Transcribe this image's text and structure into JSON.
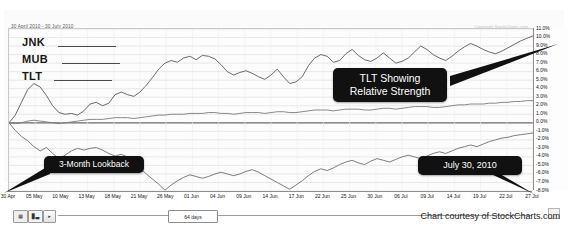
{
  "header": {
    "date_range": "30 April 2010 - 30 July 2010",
    "watermark": "Copyright StockCharts.com"
  },
  "legend": {
    "items": [
      {
        "label": "JNK",
        "swatch": "line-swatch"
      },
      {
        "label": "MUB",
        "swatch": "line-swatch"
      },
      {
        "label": "TLT",
        "swatch": "line-swatch"
      }
    ]
  },
  "callouts": {
    "tlt": "TLT Showing\nRelative Strength",
    "tlt_line1": "TLT Showing",
    "tlt_line2": "Relative Strength",
    "lookback": "3-Month Lookback",
    "date": "July 30, 2010"
  },
  "toolbar": {
    "grid_button": "grid-icon",
    "bars_button": "bars-icon",
    "arrow_button": "▸",
    "slider_value": "64 days"
  },
  "footer": {
    "credit": "Chart courtesy of StockCharts.com"
  },
  "chart_data": {
    "type": "line",
    "title": "",
    "subtitle": "30 April 2010 - 30 July 2010",
    "xlabel": "",
    "ylabel": "Percent Change",
    "ylim": [
      -8,
      11
    ],
    "ytick_labels": [
      "11.0%",
      "10.0%",
      "9.0%",
      "8.0%",
      "7.0%",
      "6.0%",
      "5.0%",
      "4.0%",
      "3.0%",
      "2.0%",
      "1.0%",
      "0.0%",
      "-1.0%",
      "-2.0%",
      "-3.0%",
      "-4.0%",
      "-5.0%",
      "-6.0%",
      "-7.0%",
      "-8.0%"
    ],
    "ytick_values": [
      11,
      10,
      9,
      8,
      7,
      6,
      5,
      4,
      3,
      2,
      1,
      0,
      -1,
      -2,
      -3,
      -4,
      -5,
      -6,
      -7,
      -8
    ],
    "xtick_labels": [
      "30 Apr",
      "05 May",
      "10 May",
      "13 May",
      "18 May",
      "21 May",
      "26 May",
      "01 Jun",
      "04 Jun",
      "09 Jun",
      "14 Jun",
      "17 Jun",
      "22 Jun",
      "25 Jun",
      "30 Jun",
      "06 Jul",
      "09 Jul",
      "14 Jul",
      "19 Jul",
      "22 Jul",
      "27 Jul"
    ],
    "grid": true,
    "legend_position": "top-left",
    "zero_line": 0,
    "series": [
      {
        "name": "TLT",
        "color": "#5a5a5a",
        "values": [
          0.0,
          0.9,
          2.4,
          3.9,
          4.6,
          4.2,
          3.2,
          2.0,
          1.2,
          1.0,
          1.1,
          0.9,
          1.4,
          2.2,
          2.4,
          2.0,
          2.3,
          3.3,
          3.6,
          3.3,
          3.1,
          3.6,
          4.4,
          5.3,
          6.3,
          7.0,
          7.3,
          7.1,
          7.6,
          7.8,
          7.4,
          7.9,
          7.8,
          7.5,
          6.8,
          6.0,
          5.6,
          5.9,
          6.1,
          5.8,
          5.4,
          5.1,
          5.6,
          6.3,
          5.4,
          4.6,
          4.8,
          5.4,
          6.7,
          7.6,
          8.0,
          7.8,
          7.1,
          7.3,
          8.1,
          8.6,
          7.9,
          7.4,
          7.2,
          7.6,
          8.2,
          7.6,
          7.0,
          7.2,
          7.6,
          8.3,
          9.0,
          8.6,
          8.0,
          7.6,
          7.3,
          7.8,
          8.4,
          8.9,
          9.3,
          9.0,
          8.6,
          8.3,
          8.1,
          8.4,
          8.8,
          9.2,
          9.6,
          9.9,
          10.2
        ]
      },
      {
        "name": "MUB",
        "color": "#7a7a7a",
        "values": [
          0.0,
          -0.1,
          0.0,
          0.2,
          0.3,
          0.2,
          0.1,
          0.0,
          -0.1,
          0.0,
          0.1,
          0.2,
          0.3,
          0.4,
          0.4,
          0.4,
          0.5,
          0.6,
          0.6,
          0.6,
          0.5,
          0.6,
          0.7,
          0.8,
          0.9,
          0.9,
          1.0,
          1.0,
          1.0,
          1.1,
          1.1,
          1.1,
          1.2,
          1.2,
          1.1,
          1.1,
          1.0,
          1.1,
          1.2,
          1.2,
          1.2,
          1.1,
          1.2,
          1.3,
          1.3,
          1.2,
          1.2,
          1.3,
          1.4,
          1.5,
          1.5,
          1.5,
          1.4,
          1.5,
          1.6,
          1.6,
          1.6,
          1.5,
          1.5,
          1.6,
          1.7,
          1.7,
          1.6,
          1.7,
          1.8,
          1.9,
          1.9,
          1.9,
          1.8,
          1.8,
          1.9,
          2.0,
          2.1,
          2.1,
          2.2,
          2.2,
          2.2,
          2.3,
          2.3,
          2.4,
          2.4,
          2.5,
          2.5,
          2.6,
          2.6
        ]
      },
      {
        "name": "JNK",
        "color": "#6e6e6e",
        "values": [
          0.0,
          -0.9,
          -1.6,
          -2.1,
          -2.8,
          -3.3,
          -2.9,
          -3.6,
          -4.2,
          -3.8,
          -3.3,
          -3.0,
          -3.2,
          -3.0,
          -2.9,
          -3.2,
          -3.6,
          -3.9,
          -3.7,
          -4.0,
          -4.6,
          -5.3,
          -6.0,
          -6.6,
          -7.2,
          -7.9,
          -7.3,
          -6.8,
          -6.4,
          -6.1,
          -6.3,
          -6.5,
          -6.3,
          -6.0,
          -5.8,
          -6.0,
          -6.2,
          -6.0,
          -5.7,
          -5.5,
          -5.8,
          -6.2,
          -6.6,
          -7.0,
          -7.4,
          -7.8,
          -7.3,
          -6.8,
          -6.2,
          -5.7,
          -5.4,
          -5.6,
          -5.3,
          -4.9,
          -4.6,
          -4.4,
          -4.7,
          -4.9,
          -4.5,
          -4.2,
          -4.4,
          -4.6,
          -4.3,
          -4.0,
          -3.8,
          -4.0,
          -4.2,
          -3.9,
          -3.6,
          -3.4,
          -3.6,
          -3.3,
          -3.0,
          -2.8,
          -2.6,
          -2.8,
          -2.5,
          -2.2,
          -2.0,
          -1.8,
          -1.7,
          -1.5,
          -1.4,
          -1.3,
          -1.2
        ]
      }
    ]
  }
}
